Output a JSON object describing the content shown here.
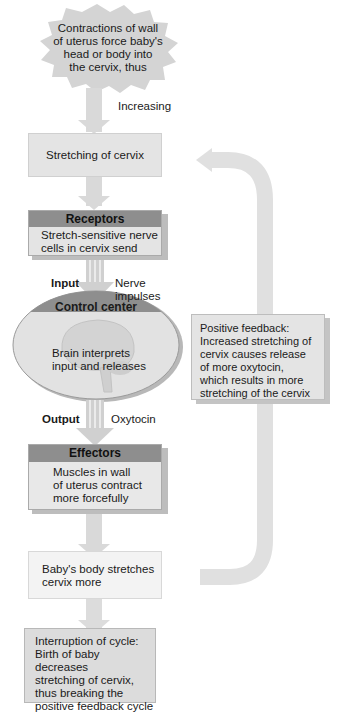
{
  "diagram": {
    "stimulus": {
      "text_lines": [
        "Contractions of wall",
        "of uterus force baby's",
        "head or body into",
        "the cervix, thus"
      ]
    },
    "increasing_label": "Increasing",
    "stretching": {
      "text": "Stretching of cervix"
    },
    "receptors": {
      "title": "Receptors",
      "text_lines": [
        "Stretch-sensitive nerve",
        "cells in cervix send"
      ]
    },
    "input": {
      "label": "Input",
      "signal_lines": [
        "Nerve",
        "impulses"
      ]
    },
    "control_center": {
      "title": "Control center",
      "text_lines": [
        "Brain interprets",
        "input and releases"
      ],
      "icon": "brain-icon"
    },
    "output": {
      "label": "Output",
      "signal": "Oxytocin"
    },
    "effectors": {
      "title": "Effectors",
      "text_lines": [
        "Muscles in wall",
        "of uterus contract",
        "more forcefully"
      ]
    },
    "result": {
      "text_lines": [
        "Baby's body stretches",
        "cervix more"
      ]
    },
    "feedback_note": {
      "text_lines": [
        "Positive feedback:",
        "Increased stretching of",
        "cervix causes release",
        "of more oxytocin,",
        "which  results in more",
        "stretching of the cervix"
      ]
    },
    "interruption": {
      "text_lines": [
        "Interruption of cycle:",
        "Birth of baby decreases",
        "stretching of cervix,",
        "thus breaking the",
        "positive feedback cycle"
      ]
    },
    "colors": {
      "arrow": "#d9d9d9",
      "box_light": "#e4e4e4",
      "box_white": "#f3f3f3",
      "header": "#8e8e8e",
      "shadow": "#bdbdbd"
    }
  }
}
